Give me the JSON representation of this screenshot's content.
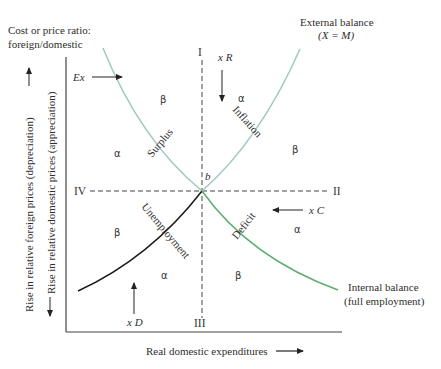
{
  "title": {
    "y_axis_title_line1": "Cost or price ratio:",
    "y_axis_title_line2": "foreign/domestic"
  },
  "axes": {
    "x_label": "Real domestic expenditures",
    "y_label_outer": "Rise in relative foreign prices (depreciation)",
    "y_label_inner": "Rise in relative domestic prices (appreciation)"
  },
  "curves": {
    "external_balance": {
      "label_line1": "External balance",
      "label_line2": "(X = M)",
      "color": "#9ec9c2",
      "segment_left_label": "Surplus",
      "segment_right_label": "Inflation"
    },
    "internal_balance": {
      "label_line1": "Internal balance",
      "label_line2": "(full employment)",
      "color_left": "#1a1a1a",
      "color_right": "#5aae6e",
      "segment_left_label": "Unemployment",
      "segment_right_label": "Deficit"
    }
  },
  "intersection": {
    "label": "b"
  },
  "zones": {
    "I": "I",
    "II": "II",
    "III": "III",
    "IV": "IV"
  },
  "arrows": {
    "ex": "Ex",
    "xr": "x R",
    "xc": "x C",
    "xd": "x D"
  },
  "region_marks": {
    "alpha": "α",
    "beta": "β"
  }
}
